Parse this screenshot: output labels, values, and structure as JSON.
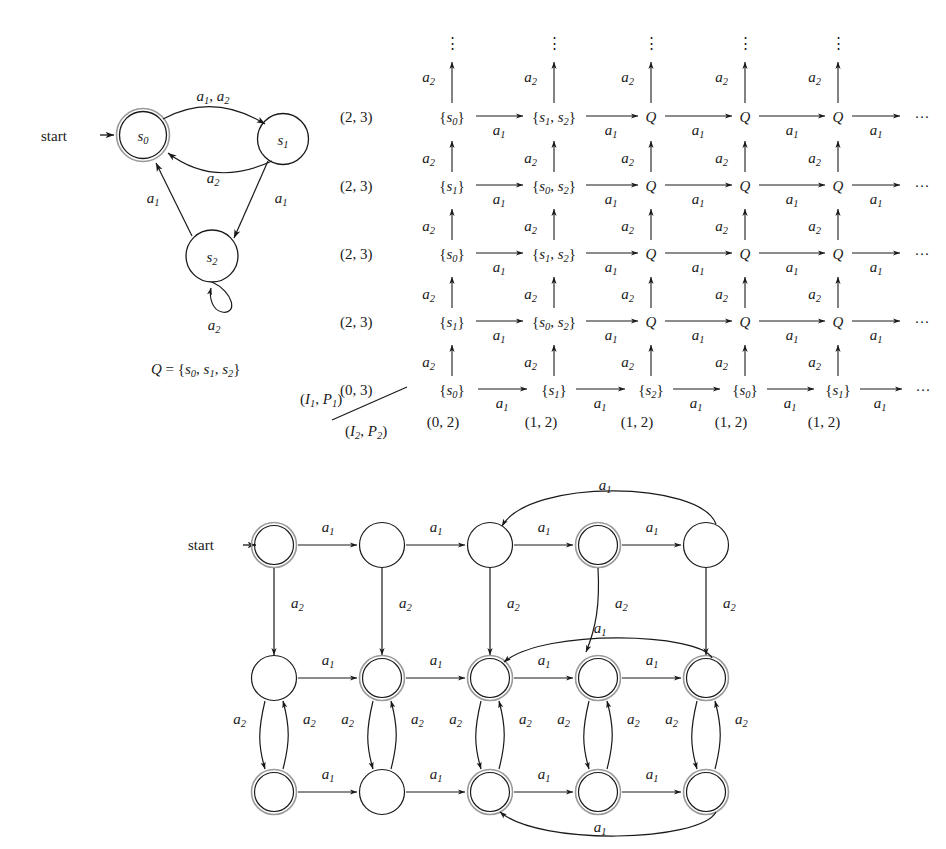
{
  "figure": {
    "kind": "automata-theory-figure",
    "background": "#ffffff",
    "ink": "#1a1a1a"
  },
  "top_automaton": {
    "name": "nondeterministic-automaton",
    "start_label": "start",
    "states": [
      {
        "id": "s0",
        "label": "s",
        "sub": "0",
        "accepting": true,
        "cx": 143,
        "cy": 135,
        "r": 26
      },
      {
        "id": "s1",
        "label": "s",
        "sub": "1",
        "accepting": false,
        "cx": 282,
        "cy": 139,
        "r": 25
      },
      {
        "id": "s2",
        "label": "s",
        "sub": "2",
        "accepting": false,
        "cx": 212,
        "cy": 255,
        "r": 26
      }
    ],
    "transitions": [
      {
        "from": "s0",
        "to": "s1",
        "label": "a",
        "sub": "1, a2",
        "text": "a1, a2",
        "lx": 212,
        "ly": 100
      },
      {
        "from": "s1",
        "to": "s0",
        "label": "a",
        "sub": "2",
        "text": "a2",
        "lx": 213,
        "ly": 177
      },
      {
        "from": "s1",
        "to": "s2",
        "label": "a",
        "sub": "1",
        "text": "a1",
        "lx": 280,
        "ly": 200
      },
      {
        "from": "s2",
        "to": "s0",
        "label": "a",
        "sub": "1",
        "text": "a1",
        "lx": 152,
        "ly": 199
      },
      {
        "from": "s2",
        "to": "s2",
        "label": "a",
        "sub": "2",
        "text": "a2",
        "lx": 214,
        "ly": 316,
        "self_loop": true
      }
    ],
    "q_definition": {
      "text": "Q = {s0, s1, s2}",
      "x": 150,
      "y": 370
    }
  },
  "grid_diagram": {
    "name": "subset-construction-grid",
    "axis_labels": {
      "upper": "(I1, P1)",
      "lower": "(I2, P2)"
    },
    "vertical_arrow_label": "a2",
    "horizontal_arrow_label": "a1",
    "vertical_dots": "⋮",
    "horizontal_dots": "···",
    "row_left_labels": [
      "(2, 3)",
      "(2, 3)",
      "(2, 3)",
      "(2, 3)",
      "(0, 3)"
    ],
    "bottom_labels": [
      "(0, 2)",
      "(1, 2)",
      "(1, 2)",
      "(1, 2)",
      "(1, 2)"
    ],
    "rows": [
      {
        "left": "(2, 3)",
        "cells": [
          "{s0}",
          "{s1, s2}",
          "Q",
          "Q",
          "Q"
        ]
      },
      {
        "left": "(2, 3)",
        "cells": [
          "{s1}",
          "{s0, s2}",
          "Q",
          "Q",
          "Q"
        ]
      },
      {
        "left": "(2, 3)",
        "cells": [
          "{s0}",
          "{s1, s2}",
          "Q",
          "Q",
          "Q"
        ]
      },
      {
        "left": "(2, 3)",
        "cells": [
          "{s1}",
          "{s0, s2}",
          "Q",
          "Q",
          "Q"
        ]
      },
      {
        "left": "(0, 3)",
        "cells": [
          "{s0}",
          "{s1}",
          "{s2}",
          "{s0}",
          "{s1}"
        ]
      }
    ]
  },
  "bottom_automaton": {
    "name": "deterministic-product-automaton",
    "start_label": "start",
    "edge_label_a1": "a1",
    "edge_label_a2": "a2",
    "rows": [
      {
        "row": 0,
        "accepting": [
          true,
          false,
          false,
          true,
          false
        ]
      },
      {
        "row": 1,
        "accepting": [
          false,
          true,
          true,
          true,
          true
        ]
      },
      {
        "row": 2,
        "accepting": [
          true,
          false,
          true,
          true,
          true
        ]
      }
    ],
    "wrap_arcs": [
      {
        "name": "top-row-wrap",
        "label": "a1"
      },
      {
        "name": "middle-row-wrap",
        "label": "a1"
      },
      {
        "name": "bottom-row-wrap",
        "label": "a1"
      },
      {
        "name": "middle-col-down",
        "label": "a2"
      }
    ]
  }
}
